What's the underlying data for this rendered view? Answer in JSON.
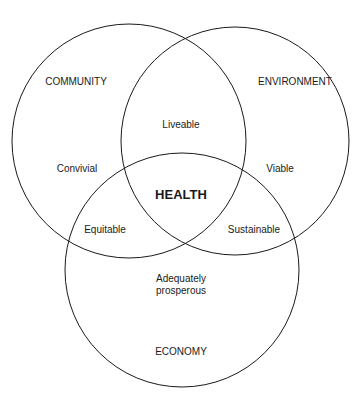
{
  "diagram": {
    "type": "venn",
    "circles": [
      {
        "name": "COMMUNITY",
        "cx": 129,
        "cy": 141,
        "r": 117
      },
      {
        "name": "ENVIRONMENT",
        "cx": 235,
        "cy": 141,
        "r": 114
      },
      {
        "name": "ECONOMY",
        "cx": 182,
        "cy": 270,
        "r": 117
      }
    ],
    "stroke_color": "#1a1a1a",
    "labels": {
      "community": "COMMUNITY",
      "environment": "ENVIRONMENT",
      "economy": "ECONOMY",
      "liveable": "Liveable",
      "convivial": "Convivial",
      "viable": "Viable",
      "health": "HEALTH",
      "equitable": "Equitable",
      "sustainable": "Sustainable",
      "adequately": "Adequately",
      "prosperous": "prosperous"
    }
  }
}
